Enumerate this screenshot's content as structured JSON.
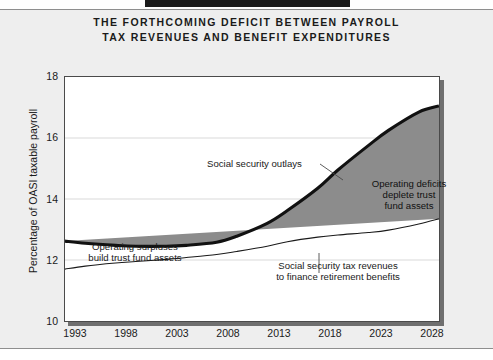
{
  "title": {
    "line1": "THE FORTHCOMING DEFICIT BETWEEN PAYROLL",
    "line2": "TAX REVENUES AND BENEFIT EXPENDITURES"
  },
  "axis": {
    "y_title": "Percentage of OASI taxable payroll",
    "y_ticks": [
      "18",
      "16",
      "14",
      "12",
      "10"
    ],
    "x_ticks": [
      "1993",
      "1998",
      "2003",
      "2008",
      "2013",
      "2018",
      "2023",
      "2028"
    ]
  },
  "annotations": {
    "outlays": "Social security outlays",
    "deficit_l1": "Operating deficits",
    "deficit_l2": "deplete trust",
    "deficit_l3": "fund assets",
    "surplus_l1": "Operating surpluses",
    "surplus_l2": "build trust fund assets",
    "revenue_l1": "Social security tax revenues",
    "revenue_l2": "to finance retirement benefits"
  },
  "colors": {
    "fill_gray": "#8c8c8c",
    "outlays_line": "#111111",
    "revenue_line": "#111111",
    "grid": "#d9d9d9",
    "page_bg": "#eeeeee",
    "plot_bg": "#ffffff",
    "top_bar": "#1b1b1b"
  },
  "chart_data": {
    "type": "area",
    "title": "THE FORTHCOMING DEFICIT BETWEEN PAYROLL TAX REVENUES AND BENEFIT EXPENDITURES",
    "xlabel": "",
    "ylabel": "Percentage of OASI taxable payroll",
    "xlim": [
      1993,
      2030
    ],
    "ylim": [
      10,
      18
    ],
    "ytick_values": [
      10,
      12,
      14,
      16,
      18
    ],
    "xtick_values": [
      1993,
      1998,
      2003,
      2008,
      2013,
      2018,
      2023,
      2028
    ],
    "grid": true,
    "legend": "none",
    "crossover_year": 2013,
    "x": [
      1993,
      1995,
      1998,
      2000,
      2003,
      2005,
      2008,
      2010,
      2013,
      2015,
      2018,
      2020,
      2023,
      2025,
      2028,
      2030
    ],
    "series": [
      {
        "name": "Social security outlays",
        "values": [
          12.62,
          12.55,
          12.48,
          12.45,
          12.45,
          12.48,
          12.58,
          12.78,
          13.2,
          13.62,
          14.35,
          14.95,
          15.75,
          16.25,
          16.85,
          17.05
        ]
      },
      {
        "name": "Social security tax revenues",
        "values": [
          11.7,
          11.8,
          11.9,
          11.95,
          12.02,
          12.08,
          12.18,
          12.28,
          12.45,
          12.6,
          12.75,
          12.82,
          12.9,
          12.98,
          13.18,
          13.35
        ]
      }
    ],
    "fill_between": {
      "label_below_crossover": "Operating surpluses build trust fund assets",
      "label_above_crossover": "Operating deficits deplete trust fund assets",
      "color": "#8c8c8c"
    }
  }
}
